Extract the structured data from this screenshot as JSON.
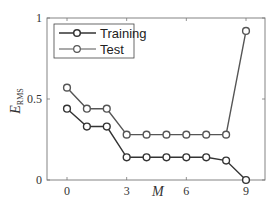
{
  "chart_data": {
    "type": "line",
    "title": "",
    "xlabel": "M",
    "ylabel": "E_RMS",
    "ylabel_main": "E",
    "ylabel_sub": "RMS",
    "x": [
      0,
      1,
      2,
      3,
      4,
      5,
      6,
      7,
      8,
      9
    ],
    "xlim": [
      -1,
      10
    ],
    "ylim": [
      0,
      1
    ],
    "xticks": [
      0,
      3,
      6,
      9
    ],
    "xtick_labels": [
      "0",
      "3",
      "6",
      "9"
    ],
    "yticks": [
      0,
      0.5,
      1
    ],
    "ytick_labels": [
      "0",
      "0.5",
      "1"
    ],
    "grid": false,
    "legend_position": "upper left",
    "series": [
      {
        "name": "Training",
        "color": "#333333",
        "marker": "circle-open",
        "values": [
          0.44,
          0.33,
          0.33,
          0.14,
          0.14,
          0.14,
          0.14,
          0.14,
          0.12,
          0.0
        ]
      },
      {
        "name": "Test",
        "color": "#555555",
        "marker": "circle-open",
        "values": [
          0.57,
          0.44,
          0.44,
          0.28,
          0.28,
          0.28,
          0.28,
          0.28,
          0.28,
          0.92
        ]
      }
    ]
  },
  "legend": {
    "items": [
      {
        "label": "Training"
      },
      {
        "label": "Test"
      }
    ]
  }
}
